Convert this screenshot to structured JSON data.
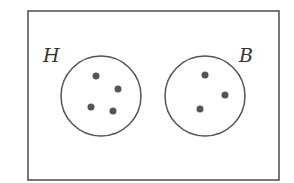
{
  "diagram": {
    "type": "venn",
    "universe": {
      "label": ""
    },
    "sets": [
      {
        "label": "H",
        "element_count": 4
      },
      {
        "label": "B",
        "element_count": 3
      }
    ],
    "colors": {
      "stroke": "#555555",
      "dot": "#555555",
      "background": "#ffffff"
    }
  }
}
